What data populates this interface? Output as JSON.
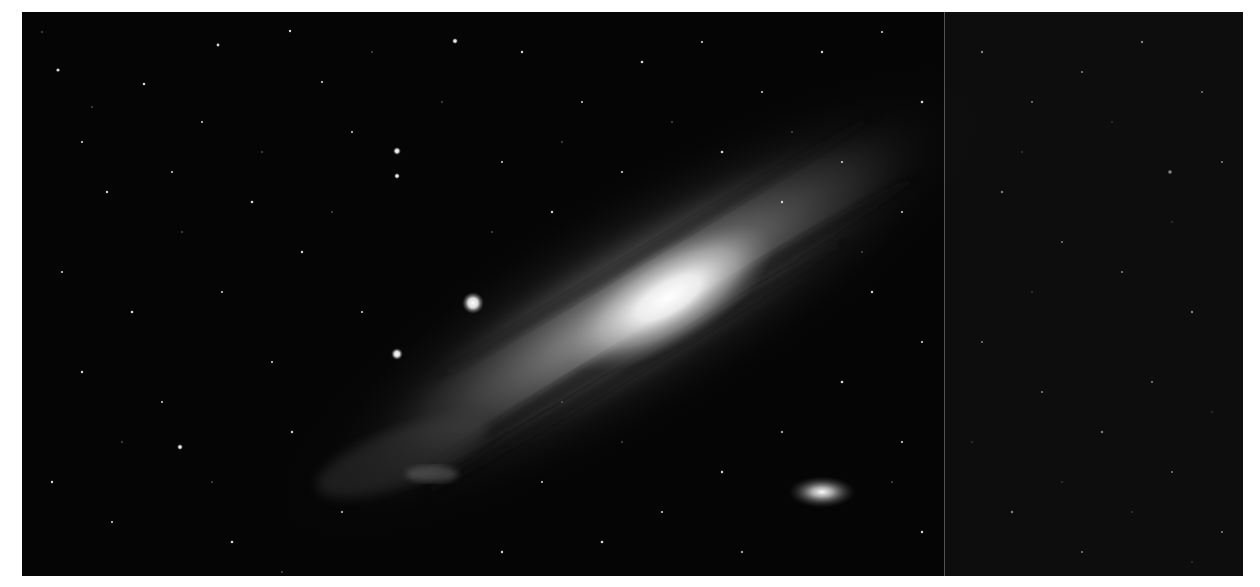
{
  "image": {
    "subject": "Andromeda Galaxy with satellite galaxies on a star field",
    "palette": {
      "background": "#050505",
      "core": "#f4f4f4",
      "disk": "#8a8a8a",
      "dust": "#1a1a1a",
      "stars": "#e6e6e6",
      "seam": "#8c8c8c"
    },
    "features": [
      {
        "name": "galaxy-core",
        "x": 645,
        "y": 300
      },
      {
        "name": "satellite-galaxy-lower-right",
        "x": 822,
        "y": 492
      },
      {
        "name": "bright-star-left",
        "x": 473,
        "y": 303
      },
      {
        "name": "star-left-lower",
        "x": 397,
        "y": 354
      },
      {
        "name": "star-upper",
        "x": 397,
        "y": 151
      }
    ]
  }
}
